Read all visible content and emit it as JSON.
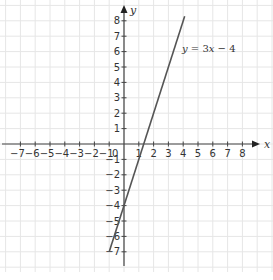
{
  "chart_data": {
    "type": "line",
    "title": "",
    "xlabel": "x",
    "ylabel": "y",
    "xlim": [
      -8,
      9
    ],
    "ylim": [
      -8,
      8.5
    ],
    "grid": true,
    "x_ticks": [
      -7,
      -6,
      -5,
      -4,
      -3,
      -2,
      -1,
      1,
      2,
      3,
      4,
      5,
      6,
      7,
      8
    ],
    "y_ticks": [
      -7,
      -6,
      -5,
      -4,
      -3,
      -2,
      -1,
      1,
      2,
      3,
      4,
      5,
      6,
      7,
      8
    ],
    "origin_label": "0",
    "series": [
      {
        "name": "y = 3x − 4",
        "equation": "y = 3x − 4",
        "slope": 3,
        "intercept": -4,
        "x": [
          -1,
          4.1
        ],
        "y": [
          -7,
          8.3
        ],
        "color": "#555555"
      }
    ],
    "annotations": [
      {
        "text": "y = 3x − 4",
        "x": 4.1,
        "y": 6.3
      }
    ]
  },
  "labels": {
    "x_axis": "x",
    "y_axis": "y",
    "origin": "0",
    "equation_y": "y",
    "equation_eq": " = 3",
    "equation_x": "x",
    "equation_rest": " − 4"
  },
  "colors": {
    "grid": "#e6e6e6",
    "axis": "#444444",
    "line": "#555555",
    "text": "#333333"
  }
}
